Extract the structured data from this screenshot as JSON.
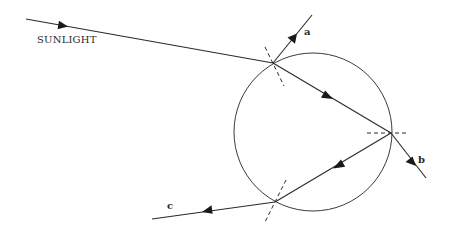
{
  "diagram": {
    "labels": {
      "sunlight": "SUNLIGHT",
      "ray_a": "a",
      "ray_b": "b",
      "ray_c": "c"
    },
    "droplet": {
      "cx": 313,
      "cy": 132,
      "r": 79
    },
    "points": {
      "entry": [
        273,
        63
      ],
      "back_reflection": [
        391,
        133
      ],
      "exit": [
        275,
        202
      ]
    },
    "rays": [
      {
        "id": "sunlight",
        "from": [
          26,
          19
        ],
        "to": [
          273,
          63
        ],
        "description": "incoming sunlight"
      },
      {
        "id": "a",
        "from": [
          273,
          63
        ],
        "to": [
          312,
          15
        ],
        "description": "reflected at entry"
      },
      {
        "id": "refracted-in",
        "from": [
          273,
          63
        ],
        "to": [
          391,
          133
        ],
        "description": "refracted into drop"
      },
      {
        "id": "b",
        "from": [
          391,
          133
        ],
        "to": [
          426,
          178
        ],
        "description": "transmitted out the back"
      },
      {
        "id": "internal-reflection",
        "from": [
          391,
          133
        ],
        "to": [
          275,
          202
        ],
        "description": "internally reflected"
      },
      {
        "id": "c",
        "from": [
          275,
          202
        ],
        "to": [
          152,
          219
        ],
        "description": "refracted out toward observer"
      }
    ],
    "normals": [
      {
        "at": "entry",
        "from": [
          265,
          47
        ],
        "to": [
          284,
          86
        ]
      },
      {
        "at": "back_reflection",
        "from": [
          367,
          133
        ],
        "to": [
          408,
          133
        ]
      },
      {
        "at": "exit",
        "from": [
          286,
          180
        ],
        "to": [
          265,
          222
        ]
      }
    ],
    "colors": {
      "line": "#2a2a2a",
      "background": "#ffffff"
    }
  }
}
